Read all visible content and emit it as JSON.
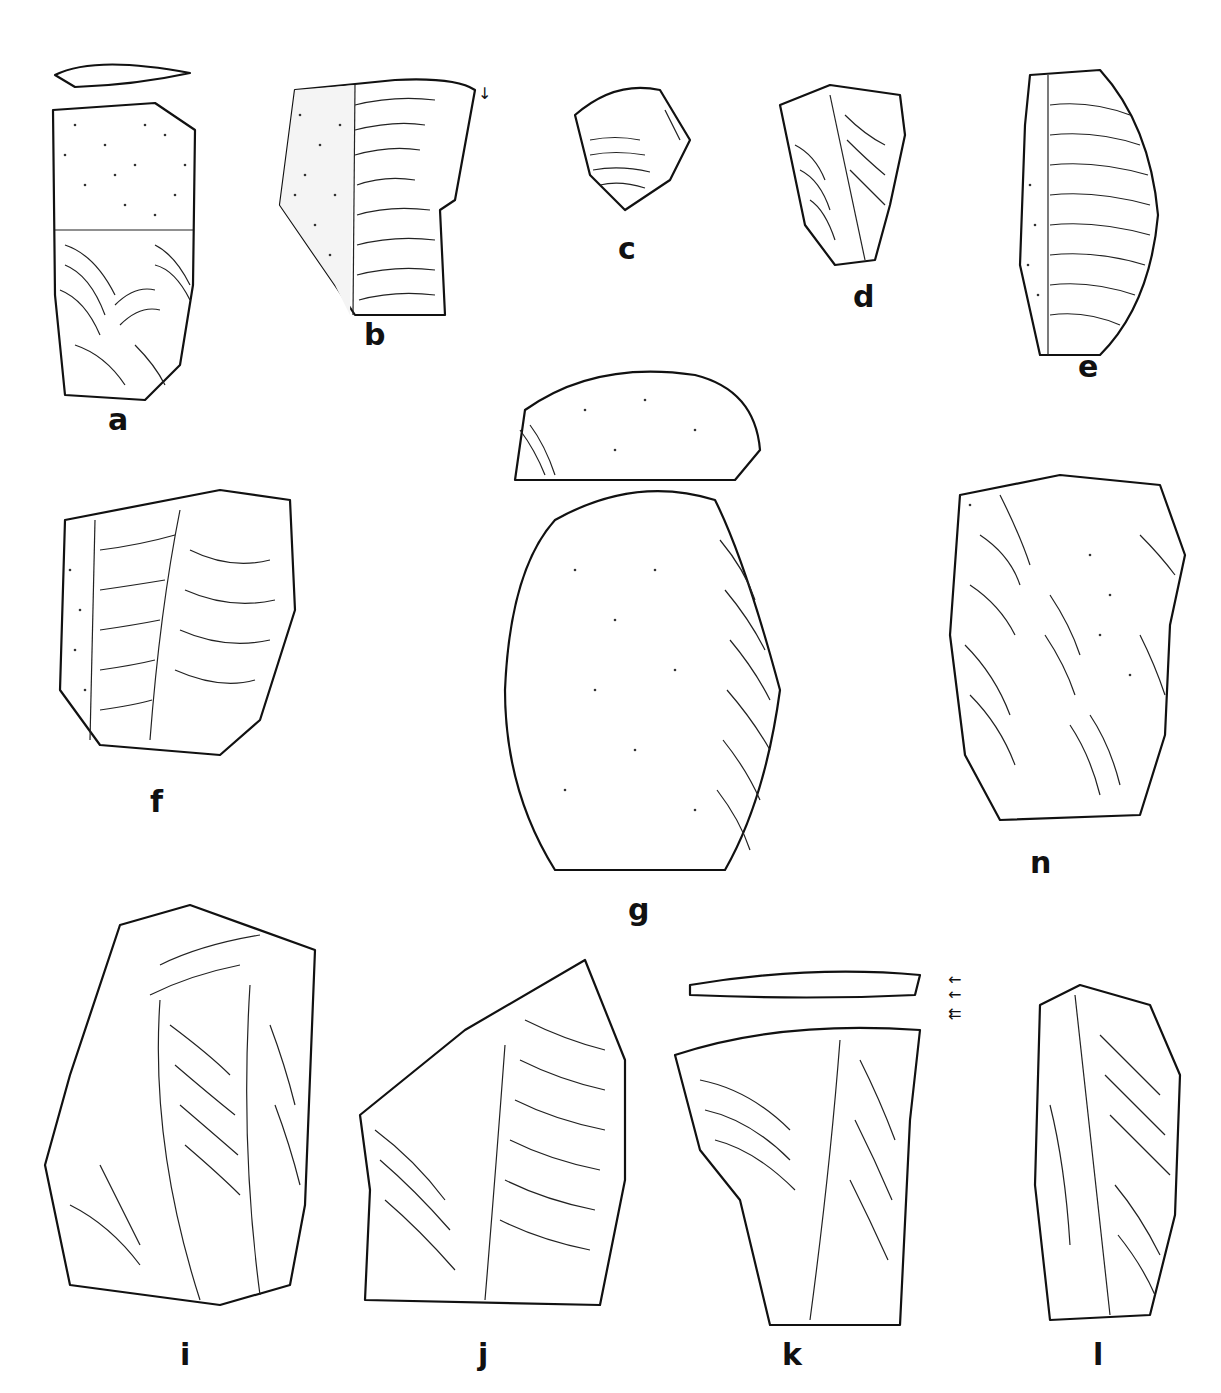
{
  "figure": {
    "type": "archaeological lithic illustration plate",
    "background": "#ffffff",
    "ink_color": "#111111"
  },
  "artifacts": [
    {
      "id": "a",
      "label": "a",
      "x": 45,
      "y": 55,
      "w": 150,
      "h": 370,
      "has_cortex": true,
      "has_section_view": true
    },
    {
      "id": "b",
      "label": "b",
      "x": 275,
      "y": 75,
      "w": 220,
      "h": 270,
      "has_cortex": true,
      "has_arrow": true
    },
    {
      "id": "c",
      "label": "c",
      "x": 565,
      "y": 80,
      "w": 130,
      "h": 140,
      "has_cortex": false
    },
    {
      "id": "d",
      "label": "d",
      "x": 775,
      "y": 85,
      "w": 140,
      "h": 185,
      "has_cortex": false
    },
    {
      "id": "e",
      "label": "e",
      "x": 1000,
      "y": 65,
      "w": 160,
      "h": 300,
      "has_cortex": true
    },
    {
      "id": "f",
      "label": "f",
      "x": 40,
      "y": 490,
      "w": 260,
      "h": 280,
      "has_cortex": true
    },
    {
      "id": "g",
      "label": "g",
      "x": 495,
      "y": 370,
      "w": 300,
      "h": 510,
      "has_cortex": true,
      "has_section_view": true
    },
    {
      "id": "n",
      "label": "n",
      "x": 940,
      "y": 475,
      "w": 250,
      "h": 355,
      "has_cortex": true
    },
    {
      "id": "i",
      "label": "i",
      "x": 40,
      "y": 905,
      "w": 280,
      "h": 420,
      "has_cortex": false
    },
    {
      "id": "j",
      "label": "j",
      "x": 355,
      "y": 960,
      "w": 280,
      "h": 355,
      "has_cortex": false
    },
    {
      "id": "k",
      "label": "k",
      "x": 660,
      "y": 970,
      "w": 300,
      "h": 355,
      "has_cortex": false,
      "has_section_view": true,
      "has_arrow": true
    },
    {
      "id": "l",
      "label": "l",
      "x": 1030,
      "y": 985,
      "w": 155,
      "h": 340,
      "has_cortex": false
    }
  ],
  "labels": {
    "a": "a",
    "b": "b",
    "c": "c",
    "d": "d",
    "e": "e",
    "f": "f",
    "g": "g",
    "n": "n",
    "i": "i",
    "j": "j",
    "k": "k",
    "l": "l"
  },
  "annotations": {
    "arrow_b": "↓",
    "arrow_k_1": "←",
    "arrow_k_2": "←",
    "arrow_k_3": "⇇"
  }
}
